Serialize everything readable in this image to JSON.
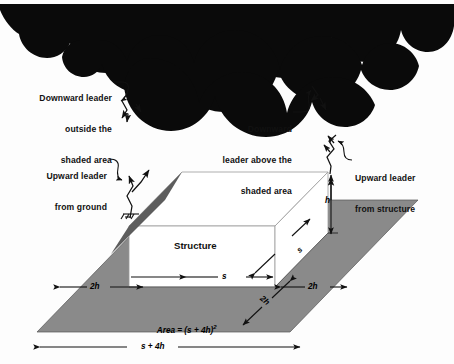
{
  "figure": {
    "type": "lightning-protection-zone-diagram",
    "colors": {
      "cloud": "#0a0a0a",
      "ground_plane": "#8a8a8a",
      "structure_face": "#ffffff",
      "line": "#1a1a1a",
      "background": "#fdfdfd"
    }
  },
  "annotations": {
    "downward_outside": {
      "line1": "Downward leader",
      "line2": "outside the",
      "line3": "shaded area"
    },
    "downward_above": {
      "line1": "Downward",
      "line2": "leader above the",
      "line3": "shaded area"
    },
    "upward_ground": {
      "line1": "Upward leader",
      "line2": "from ground"
    },
    "upward_structure": {
      "line1": "Upward leader",
      "line2": "from structure"
    }
  },
  "structure": {
    "label": "Structure"
  },
  "dimensions": {
    "width_front": "s",
    "depth_side": "s",
    "height": "h",
    "offset_left": "2h",
    "offset_right": "2h",
    "offset_front": "2h",
    "total_span": "s + 4h"
  },
  "area": {
    "prefix": "Area",
    "equals": " = (",
    "expr": "s + 4h",
    "close": ")",
    "exponent": "2",
    "full": "Area = (s + 4h)2"
  },
  "icons": {
    "cloud": "storm-cloud-icon",
    "ground": "earth-ground-icon",
    "leader": "lightning-leader-icon"
  }
}
